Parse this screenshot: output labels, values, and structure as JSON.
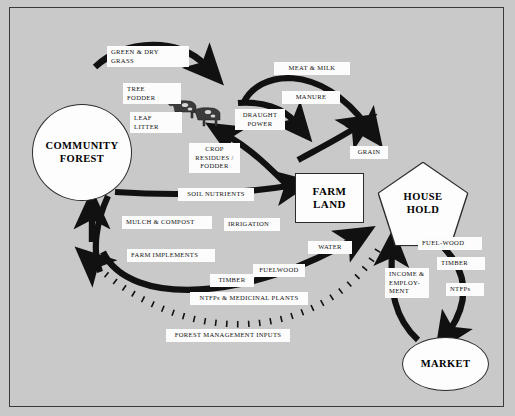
{
  "figure": {
    "background_color": "#c9c9c9",
    "frame_color": "#3a3a3a",
    "flow_color": "#111111",
    "node_fill": "#fdfdfd"
  },
  "nodes": [
    {
      "id": "community-forest",
      "label": "COMMUNITY\nFOREST",
      "line1": "COMMUNITY",
      "line2": "FOREST",
      "shape": "circle"
    },
    {
      "id": "farm-land",
      "label": "FARM LAND",
      "line1": "FARM",
      "line2": "LAND",
      "shape": "rectangle"
    },
    {
      "id": "house-hold",
      "label": "HOUSE HOLD",
      "line1": "HOUSE",
      "line2": "HOLD",
      "shape": "pentagon"
    },
    {
      "id": "market",
      "label": "MARKET",
      "line1": "MARKET",
      "line2": "",
      "shape": "ellipse"
    },
    {
      "id": "livestock",
      "label": "livestock-cattle",
      "shape": "cattle-illustration"
    }
  ],
  "flow_labels": {
    "green_dry_grass": "GREEN & DRY\nGRASS",
    "green_dry_grass_l1": "GREEN & DRY",
    "green_dry_grass_l2": "GRASS",
    "tree_fodder_l1": "TREE",
    "tree_fodder_l2": "FODDER",
    "leaf_litter_l1": "LEAF",
    "leaf_litter_l2": "LITTER",
    "meat_milk": "MEAT & MILK",
    "manure": "MANURE",
    "draught_power_l1": "DRAUGHT",
    "draught_power_l2": "POWER",
    "crop_residues_l1": "CROP",
    "crop_residues_l2": "RESIDUES /",
    "crop_residues_l3": "FODDER",
    "grain": "GRAIN",
    "soil_nutrients": "SOIL NUTRIENTS",
    "mulch_compost": "MULCH & COMPOST",
    "irrigation": "IRRIGATION",
    "farm_implements": "FARM IMPLEMENTS",
    "water": "WATER",
    "fuelwood_lower": "FUELWOOD",
    "timber_lower": "TIMBER",
    "ntfps_medicinal": "NTFPs & MEDICINAL PLANTS",
    "forest_management_inputs": "FOREST MANAGEMENT INPUTS",
    "fuel_wood_right": "FUEL-WOOD",
    "timber_right": "TIMBER",
    "ntfps_right": "NTFPs",
    "income_employment_l1": "INCOME &",
    "income_employment_l2": "EMPLOY-",
    "income_employment_l3": "MENT"
  },
  "flows": [
    {
      "from": "community-forest",
      "to": "livestock",
      "labels": [
        "GREEN & DRY GRASS",
        "TREE FODDER",
        "LEAF LITTER"
      ],
      "style": "solid"
    },
    {
      "from": "livestock",
      "to": "house-hold",
      "labels": [
        "MEAT & MILK"
      ],
      "style": "solid"
    },
    {
      "from": "livestock",
      "to": "farm-land",
      "labels": [
        "MANURE",
        "DRAUGHT POWER"
      ],
      "style": "solid"
    },
    {
      "from": "farm-land",
      "to": "livestock",
      "labels": [
        "CROP RESIDUES / FODDER"
      ],
      "style": "solid"
    },
    {
      "from": "farm-land",
      "to": "house-hold",
      "labels": [
        "GRAIN"
      ],
      "style": "solid"
    },
    {
      "from": "community-forest",
      "to": "farm-land",
      "labels": [
        "SOIL NUTRIENTS",
        "MULCH & COMPOST",
        "IRRIGATION"
      ],
      "style": "solid"
    },
    {
      "from": "community-forest",
      "to": "house-hold",
      "labels": [
        "FARM IMPLEMENTS",
        "TIMBER",
        "FUELWOOD",
        "WATER",
        "NTFPs & MEDICINAL PLANTS"
      ],
      "style": "solid"
    },
    {
      "from": "house-hold",
      "to": "market",
      "labels": [
        "FUEL-WOOD",
        "TIMBER",
        "NTFPs"
      ],
      "style": "solid"
    },
    {
      "from": "market",
      "to": "house-hold",
      "labels": [
        "INCOME & EMPLOY-MENT"
      ],
      "style": "solid"
    },
    {
      "from": "house-hold",
      "to": "community-forest",
      "labels": [
        "FOREST MANAGEMENT INPUTS"
      ],
      "style": "dashed"
    }
  ]
}
